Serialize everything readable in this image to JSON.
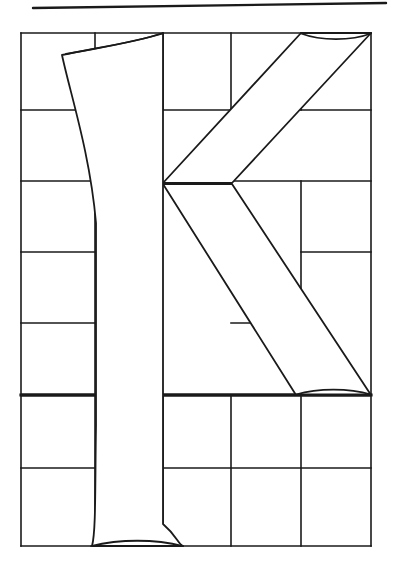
{
  "page": {
    "background_color": "#ffffff",
    "width": 399,
    "height": 576
  },
  "ink": {
    "stroke_color": "#1a1a1a",
    "fill_color": "#ffffff",
    "grid_stroke_width": 1.6,
    "heavy_stroke_width": 3.2,
    "letter_stroke_width": 1.8
  },
  "figure": {
    "kind": "letterform-construction-diagram",
    "letter": "K",
    "script_style": "serif-roman-capital"
  },
  "rule": {
    "name": "top-rule",
    "x1": 33,
    "y1": 8,
    "x2": 386,
    "y2": 3
  },
  "grid": {
    "left": 21,
    "right": 371,
    "top": 33,
    "bottom": 546,
    "baseline_y": 395,
    "columns_x": [
      21,
      95,
      163,
      231,
      301,
      371
    ],
    "rows_y": [
      33,
      110,
      181,
      252,
      323,
      395,
      468,
      546
    ],
    "heavy_rows_y": [
      395
    ],
    "column_count": 5,
    "row_count": 7
  },
  "grid_segments": {
    "horizontal": [
      {
        "name": "row-top",
        "y": 33,
        "x1": 21,
        "x2": 371,
        "heavy": false
      },
      {
        "name": "row-1-left",
        "y": 110,
        "x1": 21,
        "x2": 95,
        "heavy": false
      },
      {
        "name": "row-1-midleft",
        "y": 110,
        "x1": 163,
        "x2": 231,
        "heavy": false
      },
      {
        "name": "row-1-right",
        "y": 110,
        "x1": 301,
        "x2": 371,
        "heavy": false
      },
      {
        "name": "row-2-left",
        "y": 181,
        "x1": 21,
        "x2": 95,
        "heavy": false
      },
      {
        "name": "row-2-right",
        "y": 181,
        "x1": 231,
        "x2": 371,
        "heavy": false
      },
      {
        "name": "row-3-left",
        "y": 252,
        "x1": 21,
        "x2": 95,
        "heavy": false
      },
      {
        "name": "row-3-right",
        "y": 252,
        "x1": 301,
        "x2": 371,
        "heavy": false
      },
      {
        "name": "row-4-left",
        "y": 323,
        "x1": 21,
        "x2": 95,
        "heavy": false
      },
      {
        "name": "row-4-midright",
        "y": 323,
        "x1": 231,
        "x2": 301,
        "heavy": false
      },
      {
        "name": "baseline-left",
        "y": 395,
        "x1": 21,
        "x2": 95,
        "heavy": true
      },
      {
        "name": "baseline-right",
        "y": 395,
        "x1": 163,
        "x2": 371,
        "heavy": true
      },
      {
        "name": "row-6-left",
        "y": 468,
        "x1": 21,
        "x2": 95,
        "heavy": false
      },
      {
        "name": "row-6-right",
        "y": 468,
        "x1": 163,
        "x2": 371,
        "heavy": false
      },
      {
        "name": "row-bottom-left",
        "y": 546,
        "x1": 21,
        "x2": 95,
        "heavy": false
      },
      {
        "name": "row-bottom-right",
        "y": 546,
        "x1": 163,
        "x2": 371,
        "heavy": false
      }
    ],
    "vertical": [
      {
        "name": "col-left-border",
        "x": 21,
        "y1": 33,
        "y2": 546
      },
      {
        "name": "col-1",
        "x": 95,
        "y1": 33,
        "y2": 546
      },
      {
        "name": "col-2-upper",
        "x": 163,
        "y1": 33,
        "y2": 110
      },
      {
        "name": "col-2-lower",
        "x": 163,
        "y1": 395,
        "y2": 546
      },
      {
        "name": "col-3-upper",
        "x": 231,
        "y1": 33,
        "y2": 110
      },
      {
        "name": "col-3-mid",
        "x": 231,
        "y1": 181,
        "y2": 252
      },
      {
        "name": "col-3-lower",
        "x": 231,
        "y1": 395,
        "y2": 546
      },
      {
        "name": "col-4-upper",
        "x": 301,
        "y1": 33,
        "y2": 110
      },
      {
        "name": "col-4-mid",
        "x": 301,
        "y1": 181,
        "y2": 323
      },
      {
        "name": "col-4-lower",
        "x": 301,
        "y1": 395,
        "y2": 546
      },
      {
        "name": "col-right-border",
        "x": 371,
        "y1": 33,
        "y2": 546
      }
    ]
  },
  "letter_outline": {
    "name": "letter-k-outline",
    "stem": {
      "name": "k-stem",
      "top_serif_left_x": 62,
      "top_serif_right_x": 163,
      "cap_y": 33,
      "baseline_y": 395,
      "body_left_x": 96,
      "body_right_x": 163,
      "foot_serif_left_x": 92,
      "foot_serif_right_x": 183,
      "foot_y": 546
    },
    "upper_arm": {
      "name": "k-upper-arm",
      "top_left_x": 301,
      "top_right_x": 371,
      "top_y": 33,
      "junction_outer_x": 163,
      "junction_outer_y": 183,
      "junction_inner_x": 232,
      "junction_inner_y": 183
    },
    "leg": {
      "name": "k-leg",
      "junction_x": 163,
      "junction_y": 184,
      "foot_left_x": 296,
      "foot_right_x": 371,
      "foot_y": 395
    }
  }
}
